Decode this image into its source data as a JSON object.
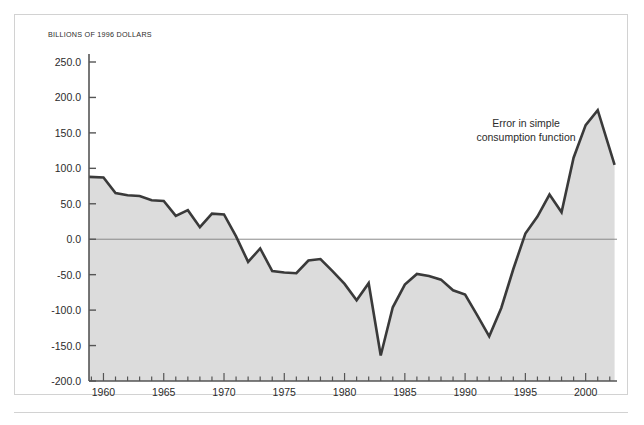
{
  "figure": {
    "axis_unit_label": "BILLIONS OF 1996 DOLLARS",
    "annotation": "Error in simple consumption function",
    "colors": {
      "line": "#3a3a3a",
      "fill": "#dcdcdc",
      "axis": "#555555",
      "zero_line": "#8a8a8a",
      "frame": "#d2d2d2",
      "text": "#2b2b2b"
    }
  },
  "chart_data": {
    "type": "area",
    "title": "",
    "subtitle": "",
    "xlabel": "",
    "ylabel": "BILLIONS OF 1996 DOLLARS",
    "annotations": [
      {
        "text": "Error in simple consumption function",
        "x": 1997.0,
        "y": 140.0
      }
    ],
    "legend": [],
    "legend_position": "none",
    "grid": false,
    "xlim": [
      1958.8,
      2002.6
    ],
    "ylim": [
      -200.0,
      250.0
    ],
    "yticks": [
      -200.0,
      -150.0,
      -100.0,
      -50.0,
      0.0,
      50.0,
      100.0,
      150.0,
      200.0,
      250.0
    ],
    "ytick_labels": [
      "-200.0",
      "-150.0",
      "-100.0",
      "-50.0",
      "0.0",
      "50.0",
      "100.0",
      "150.0",
      "200.0",
      "250.0"
    ],
    "xticks": [
      1960,
      1965,
      1970,
      1975,
      1980,
      1985,
      1990,
      1995,
      2000
    ],
    "xtick_labels": [
      "1960",
      "1965",
      "1970",
      "1975",
      "1980",
      "1985",
      "1990",
      "1995",
      "2000"
    ],
    "xtick_minor_step": 1,
    "zero_line": 0.0,
    "baseline": -200.0,
    "series": [
      {
        "name": "Error in simple consumption function",
        "x": [
          1958.8,
          1960,
          1961,
          1962,
          1963,
          1964,
          1965,
          1966,
          1967,
          1968,
          1969,
          1970,
          1971,
          1972,
          1973,
          1974,
          1975,
          1976,
          1977,
          1978,
          1979,
          1980,
          1981,
          1982,
          1983,
          1984,
          1985,
          1986,
          1987,
          1988,
          1989,
          1990,
          1991,
          1992,
          1993,
          1994,
          1995,
          1996,
          1997,
          1998,
          1999,
          2000,
          2001,
          2002.4
        ],
        "y": [
          88,
          87,
          65,
          62,
          61,
          55,
          54,
          33,
          41,
          17,
          36,
          35,
          4,
          -32,
          -13,
          -45,
          -47,
          -48,
          -30,
          -28,
          -45,
          -63,
          -86,
          -62,
          -164,
          -96,
          -64,
          -49,
          -52,
          -57,
          -72,
          -78,
          -107,
          -137,
          -97,
          -42,
          8,
          32,
          63,
          38,
          115,
          161,
          182,
          105
        ]
      }
    ]
  }
}
